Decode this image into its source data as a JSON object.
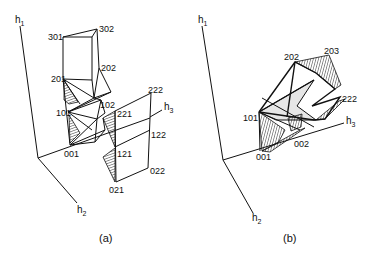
{
  "figure": {
    "panel_a": {
      "caption": "(a)",
      "axes": {
        "h1": "h",
        "h1_sub": "1",
        "h2": "h",
        "h2_sub": "2",
        "h3": "h",
        "h3_sub": "3"
      },
      "nodes": [
        "301",
        "302",
        "201",
        "202",
        "101",
        "102",
        "001",
        "221",
        "222",
        "122",
        "121",
        "022",
        "021"
      ]
    },
    "panel_b": {
      "caption": "(b)",
      "axes": {
        "h1": "h",
        "h1_sub": "1",
        "h2": "h",
        "h2_sub": "2",
        "h3": "h",
        "h3_sub": "3"
      },
      "nodes": [
        "202",
        "203",
        "222",
        "101",
        "001",
        "002"
      ]
    }
  }
}
